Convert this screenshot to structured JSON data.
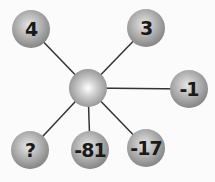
{
  "diagram": {
    "center": {
      "x": 88,
      "y": 88
    },
    "nodes": [
      {
        "label": "4",
        "x": 31,
        "y": 29
      },
      {
        "label": "3",
        "x": 146,
        "y": 28
      },
      {
        "label": "-1",
        "x": 189,
        "y": 89
      },
      {
        "label": "?",
        "x": 30,
        "y": 150
      },
      {
        "label": "-81",
        "x": 90,
        "y": 150
      },
      {
        "label": "-17",
        "x": 146,
        "y": 148
      }
    ]
  }
}
